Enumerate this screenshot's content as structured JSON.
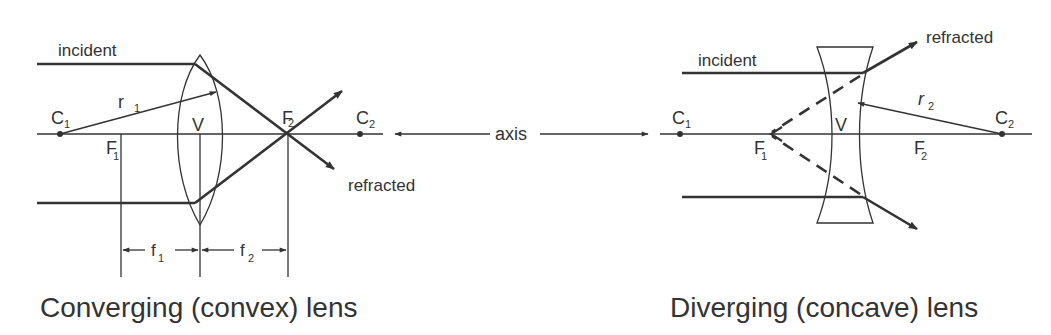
{
  "diagram": {
    "axis_label": "axis",
    "colors": {
      "ink": "#333333",
      "background": "#ffffff"
    },
    "convex": {
      "caption": "Converging (convex) lens",
      "incident": "incident",
      "refracted": "refracted",
      "c1": "C",
      "c1_sub": "1",
      "c2": "C",
      "c2_sub": "2",
      "f1": "F",
      "f1_sub": "1",
      "f2": "F",
      "f2_sub": "2",
      "r": "r",
      "r_sub": "1",
      "vertex": "V",
      "dim_f1": "f",
      "dim_f1_sub": "1",
      "dim_f2": "f",
      "dim_f2_sub": "2"
    },
    "concave": {
      "caption": "Diverging (concave) lens",
      "incident": "incident",
      "refracted": "refracted",
      "c1": "C",
      "c1_sub": "1",
      "c2": "C",
      "c2_sub": "2",
      "f1": "F",
      "f1_sub": "1",
      "f2": "F",
      "f2_sub": "2",
      "r": "r",
      "r_sub": "2",
      "vertex": "V"
    }
  }
}
